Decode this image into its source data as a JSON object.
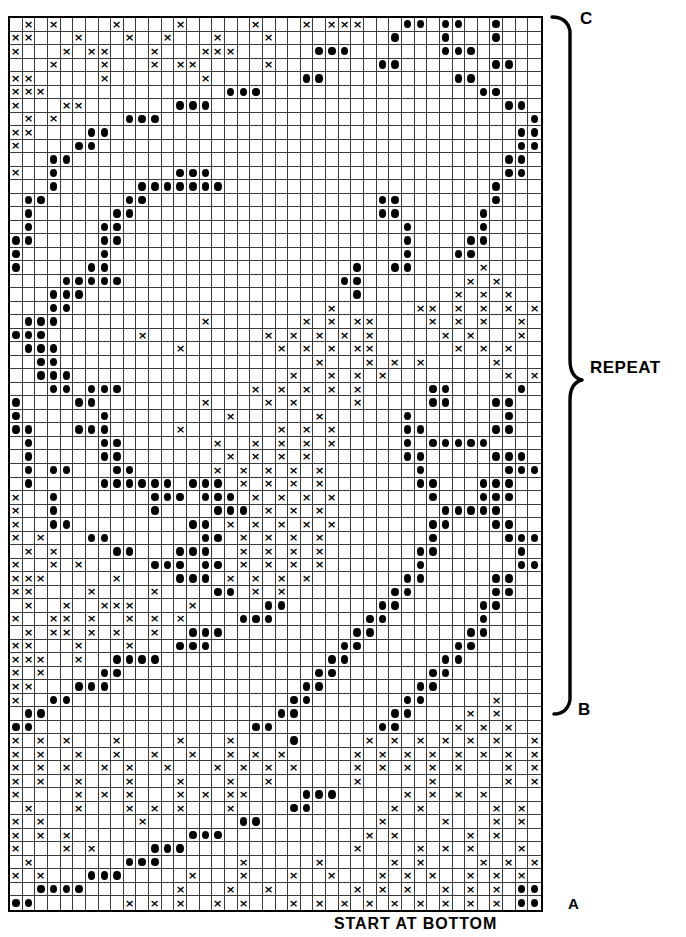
{
  "document": {
    "type": "knitting-colorwork-chart",
    "top_caption": "",
    "bottom_caption": "START AT BOTTOM"
  },
  "annotations": {
    "top_marker": "C",
    "repeat_label": "REPEAT",
    "mid_marker": "B",
    "bottom_marker": "A"
  },
  "chart_data": {
    "type": "heatmap",
    "title": "",
    "xlabel": "",
    "ylabel": "",
    "columns": 42,
    "rows": 66,
    "legend": [
      {
        "symbol": "x",
        "name": "cross-stitch-symbol"
      },
      {
        "symbol": "o",
        "name": "dot-stitch-symbol"
      },
      {
        "symbol": ".",
        "name": "blank-cell"
      }
    ],
    "grid": [
      ".x.x....x....x.....x...x.xxx...oo.oo..o.....",
      "xx...x...x..x...x...x.........o...o...o.....",
      "x...x.xx...x...xxx......ooo.......ooo.......",
      "...x...x...x.xx.....x........oo.......oo....",
      "xx.....x.......x.......oo..........oo.......",
      "xxx..............ooo.................oo.....",
      "x...xx.......ooo.......................oo...",
      ".x.x.....ooo.............................o..",
      "xx....oo................................ooo",
      "x....oo.................................oooo",
      "...oo..................................oo.oo",
      "x..o.........ooo.......................oo...",
      "...o......ooooooo.....................o.....",
      ".oo......oo..................oo.......o.....",
      ".o......oo...................oo......o......",
      ".o.....oo......................o.....o......",
      "oo.....oo......................o....oo......",
      "o......o.......................o...oo.......",
      "o.....oo...................o..oo.....x......",
      "....ooooo.................oo........x.x.....",
      "...ooo.....................o.......x.x.x....",
      "...oo....................x......xx.x.x.x.x..",
      ".ooo...........x.......x.x.xx....x.x.x..x.xx",
      "ooo.......x.........x.x.x.x.x.....x.x...x.x.",
      ".ooo.........x.......x.x.x.xx......x.x.x..x.",
      "..oo....................x...x.x.x.....x...x.",
      "..ooo.................x..x.x.x.........x.x..",
      "...oo.ooo..........x.x.x.x.x.....oo.....o...",
      "o....oo........x....x.x....x.....oo...oo....",
      "o......o.........x......x......o.......o....",
      "oo...ooo.....x.......x.x.x.....oo.....oo....",
      ".o.....oo.......x..x.x.x.x.....o.ooooo......",
      ".o.....oo........x.x.x.x.......oo.....ooo...",
      ".o.oo...oo......x.x.x.x.x.......o......ooo..",
      ".o.....oooooo.ooo.x.x.x.x.......oo...ooo....",
      "x..o.......ooo.ooo.x.x.x.x.......o...ooo....",
      "x..o.......o....ooo.x.x.x.........ooooo.....",
      "x..oo.........oo.x.x.x.x.x.......oo...oo....",
      "x.x...oo.......oo.x.x.x.x........o.....ooo..",
      ".x.x....oo...ooo..x.x.x.x.......oo......o...",
      "x..x.x.....ooo.oo.x.x.x.x.......o.......oo..",
      "xxx.....x....ooo.x.x.x.x.......oo.....oo....",
      "xx....x....x....oo.x.x........oo......oo....",
      ".x..x..xxx....x.....oo.......oo......oo.....",
      "x..xx.x..x.x.x....ooo.......oo.......o......",
      ".x.xx.x.x..x..ooo..........oo.......oo......",
      "xx...x...x...ooo..........oo.......oo.......",
      "xxx..x..oooo.............oo.......oo........",
      "x.x....oo...............oo.......oo.........",
      "xx...ooo...............oo.......oo..........",
      "x..oo.................oo.......oo.....x.....",
      ".oo..................oo.......oo....x.x.....",
      "oo.................oo........oo....x.x.x....",
      "x.x.x...x....x...x....o.....x.x.x.x.x.x..x..",
      "x.x..x..x..x..x..x.x.x.....x.x.x.x.x.x.x.xx",
      "x.x.x..x.x..x...x.x.x.x....x.x.x.x.x...x.x.",
      "x.x..x...x...x...x..x......x.....x.....x.x.",
      "x....x.x.x...x.x.xx....ooo.....x.x.x.x....x",
      ".x...x...x.x.x...x....oo......x.x.....x.x.x",
      "x.x.......x.......oo.........x....x...x.x.x",
      "x.x.x.........ooo...........x.x.....x.x...x",
      "x...x.x....ooo.............x....x.x.x...x.x",
      ".x.......ooo......x.....x.....x.x....x.x.x.",
      "x.x...ooo.....x...x...x..x...x.x.x..x.x.x.x",
      "..oooo.......x...x..x......x.x.x..x.x.x.oo.",
      "oo.......x.x.x..x.x...x.x.x.x.x.x.x.x.x.oo",
      "o....x.x.x.x.x.x....x.x.x.x.x.x......x.xoo"
    ]
  }
}
